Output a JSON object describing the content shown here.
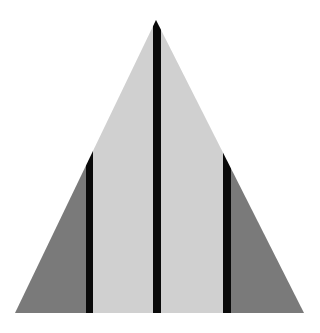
{
  "diagram": {
    "type": "triangle-striped",
    "width": 320,
    "height": 333,
    "background": "#ffffff",
    "triangle": {
      "apex": [
        156,
        20
      ],
      "base_left": [
        15,
        313
      ],
      "base_right": [
        304,
        313
      ]
    },
    "colors": {
      "center_fill": "#d0d0d0",
      "side_fill": "#7a7a7a",
      "bar": "#0a0a0a"
    },
    "bars": [
      {
        "name": "left-bar",
        "x1": 86,
        "x2": 93
      },
      {
        "name": "center-bar",
        "x1": 153,
        "x2": 161
      },
      {
        "name": "right-bar",
        "x1": 223,
        "x2": 231
      }
    ]
  }
}
